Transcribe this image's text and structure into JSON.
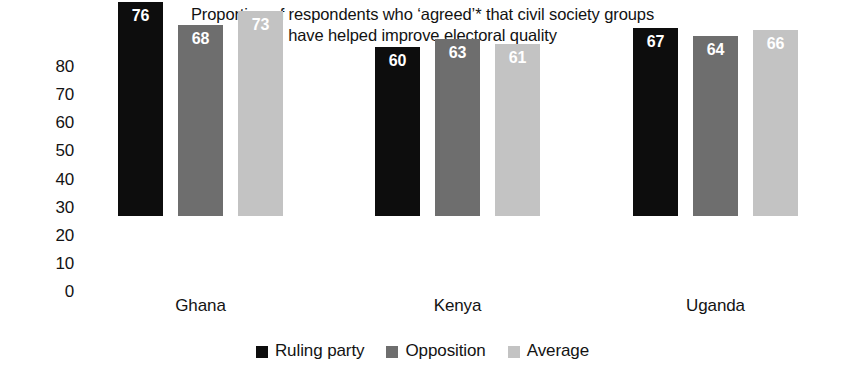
{
  "chart_data": {
    "type": "bar",
    "title": "Proportion of respondents who ‘agreed’* that civil society groups have helped improve electoral quality",
    "title_lines": [
      "Proportion of respondents who ‘agreed’* that civil society groups",
      "have helped improve electoral quality"
    ],
    "categories": [
      "Ghana",
      "Kenya",
      "Uganda"
    ],
    "series": [
      {
        "name": "Ruling party",
        "color": "#0d0d0d",
        "values": [
          76,
          60,
          67
        ]
      },
      {
        "name": "Opposition",
        "color": "#6e6e6e",
        "values": [
          68,
          63,
          64
        ]
      },
      {
        "name": "Average",
        "color": "#c3c3c3",
        "values": [
          73,
          61,
          66
        ]
      }
    ],
    "xlabel": "",
    "ylabel": "",
    "ylim": [
      0,
      80
    ],
    "y_ticks": [
      80,
      70,
      60,
      50,
      40,
      30,
      20,
      10,
      0
    ],
    "grid": false,
    "legend_position": "bottom",
    "data_labels": true
  }
}
